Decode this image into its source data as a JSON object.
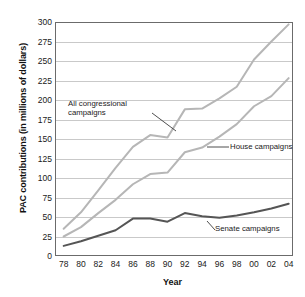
{
  "chart_data": {
    "type": "line",
    "title": "",
    "xlabel": "Year",
    "ylabel": "PAC contributions (in millions of dollars)",
    "xlim": [
      1977,
      2004.5
    ],
    "ylim": [
      0,
      300
    ],
    "ytick_labels": [
      "0",
      "25",
      "50",
      "75",
      "100",
      "125",
      "150",
      "175",
      "200",
      "225",
      "250",
      "275",
      "300"
    ],
    "ytick_values": [
      0,
      25,
      50,
      75,
      100,
      125,
      150,
      175,
      200,
      225,
      250,
      275,
      300
    ],
    "xtick_labels": [
      "78",
      "80",
      "82",
      "84",
      "86",
      "88",
      "90",
      "92",
      "94",
      "96",
      "98",
      "00",
      "02",
      "04"
    ],
    "xtick_values": [
      1978,
      1980,
      1982,
      1984,
      1986,
      1988,
      1990,
      1992,
      1994,
      1996,
      1998,
      2000,
      2002,
      2004
    ],
    "grid": true,
    "legend": "annotations-on-plot",
    "x": [
      1978,
      1980,
      1982,
      1984,
      1986,
      1988,
      1990,
      1992,
      1994,
      1996,
      1998,
      2000,
      2002,
      2004
    ],
    "series": [
      {
        "name": "All congressional campaigns",
        "color": "#b6b6b6",
        "values": [
          35,
          56,
          84,
          113,
          140,
          155,
          152,
          188,
          189,
          202,
          217,
          252,
          275,
          297
        ]
      },
      {
        "name": "House campaigns",
        "color": "#b6b6b6",
        "values": [
          25,
          37,
          55,
          72,
          92,
          105,
          107,
          133,
          139,
          153,
          169,
          192,
          205,
          228
        ]
      },
      {
        "name": "Senate campaigns",
        "color": "#555555",
        "values": [
          13,
          19,
          26,
          33,
          48,
          48,
          44,
          55,
          51,
          49,
          52,
          56,
          61,
          67
        ]
      }
    ],
    "annotations": [
      {
        "name": "all-congressional",
        "text": "All congressional\ncampaigns"
      },
      {
        "name": "house",
        "text": "House campaigns"
      },
      {
        "name": "senate",
        "text": "Senate campaigns"
      }
    ]
  },
  "axes": {
    "x_title": "Year",
    "y_title": "PAC contributions (in millions of dollars)"
  },
  "labels": {
    "all_congressional": "All congressional\ncampaigns",
    "house": "House campaigns",
    "senate": "Senate campaigns"
  },
  "colors": {
    "light_line": "#b6b6b6",
    "dark_line": "#555555",
    "grid": "#c9c9c9",
    "border": "#6b6b6b",
    "text": "#1a1a1a"
  }
}
